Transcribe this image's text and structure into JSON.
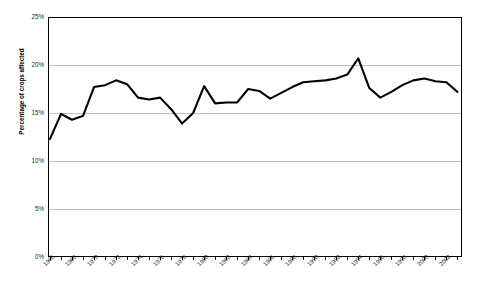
{
  "chart_data": {
    "type": "line",
    "title": "",
    "xlabel": "",
    "ylabel": "Percentage of crops affected",
    "ylim": [
      0,
      25
    ],
    "xlim": [
      1966,
      2003
    ],
    "grid": true,
    "legend": "none",
    "ytick_labels": [
      "0%",
      "5%",
      "10%",
      "15%",
      "20%",
      "25%"
    ],
    "ytick_values": [
      0,
      5,
      10,
      15,
      20,
      25
    ],
    "xtick_labels": [
      "1966",
      "1968",
      "1970",
      "1972",
      "1974",
      "1976",
      "1978",
      "1980",
      "1982",
      "1984",
      "1986",
      "1988",
      "1990",
      "1992",
      "1994",
      "1996",
      "1998",
      "2000",
      "2002"
    ],
    "x": [
      1966,
      1967,
      1968,
      1969,
      1970,
      1971,
      1972,
      1973,
      1974,
      1975,
      1976,
      1977,
      1978,
      1979,
      1980,
      1981,
      1982,
      1983,
      1984,
      1985,
      1986,
      1987,
      1988,
      1989,
      1990,
      1991,
      1992,
      1993,
      1994,
      1995,
      1996,
      1997,
      1998,
      1999,
      2000,
      2001,
      2002,
      2003
    ],
    "values": [
      12.3,
      14.9,
      14.3,
      14.7,
      17.7,
      17.9,
      18.4,
      18.0,
      16.6,
      16.4,
      16.6,
      15.4,
      13.9,
      15.0,
      17.8,
      16.0,
      16.1,
      16.1,
      17.5,
      17.3,
      16.5,
      17.1,
      17.7,
      18.2,
      18.3,
      18.4,
      18.6,
      19.0,
      20.7,
      17.6,
      16.6,
      17.2,
      17.9,
      18.4,
      18.6,
      18.3,
      18.2,
      17.2
    ],
    "series_name": "Percentage of crops affected",
    "line_color": "#000000",
    "grid_color": "#bfbfbf",
    "axis_color": "#000000"
  }
}
